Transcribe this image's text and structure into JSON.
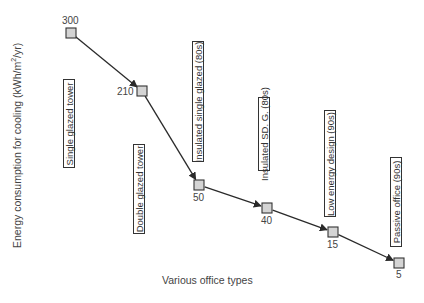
{
  "chart_data": {
    "type": "line",
    "title": "",
    "xlabel": "Various office types",
    "ylabel": "Energy consumption for cooling (kWh/m²/yr)",
    "ylabel_parts": {
      "main": "Energy consumption for cooling (kWh/m",
      "sup": "2",
      "tail": "/yr)"
    },
    "categories": [
      "Single glazed tower",
      "Double glazed tower",
      "Insulated single glazed (80s)",
      "Insulated SD. G. (80s)",
      "Low energy design (90s)",
      "Passive office (90s)"
    ],
    "values": [
      300,
      210,
      50,
      40,
      15,
      5
    ],
    "series": [
      {
        "name": "Cooling energy",
        "values": [
          300,
          210,
          50,
          40,
          15,
          5
        ]
      }
    ],
    "data_labels": [
      "300",
      "210",
      "50",
      "40",
      "15",
      "5"
    ],
    "marker": "square",
    "marker_fill": "#d4d4d4",
    "line_color": "#2a2a2a",
    "arrows": true,
    "grid": false,
    "legend": "none",
    "axes_visible": false
  }
}
